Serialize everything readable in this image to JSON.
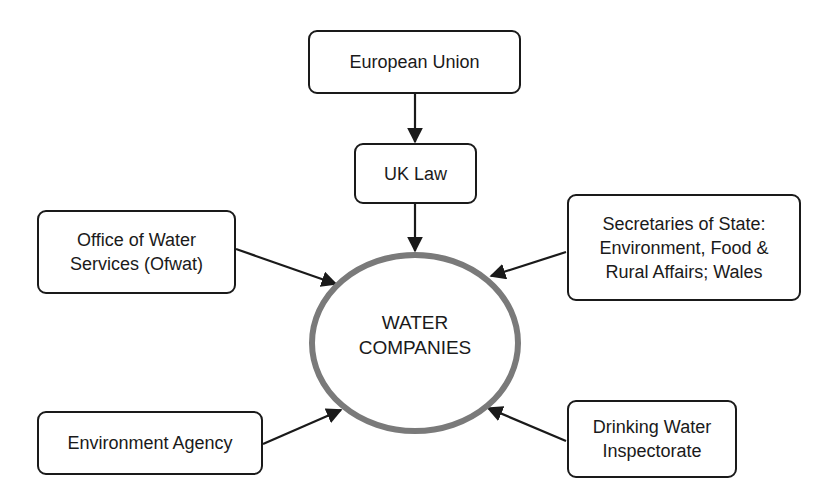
{
  "diagram": {
    "nodes": {
      "eu": {
        "label": "European Union"
      },
      "uk_law": {
        "label": "UK Law"
      },
      "ofwat": {
        "line1": "Office of Water",
        "line2": "Services (Ofwat)"
      },
      "secretaries": {
        "line1": "Secretaries of State:",
        "line2": "Environment, Food &",
        "line3": "Rural Affairs; Wales"
      },
      "env_agency": {
        "label": "Environment Agency"
      },
      "dwi": {
        "line1": "Drinking Water",
        "line2": "Inspectorate"
      },
      "water_companies": {
        "line1": "WATER",
        "line2": "COMPANIES"
      }
    },
    "edges": [
      {
        "from": "European Union",
        "to": "UK Law"
      },
      {
        "from": "UK Law",
        "to": "WATER COMPANIES"
      },
      {
        "from": "Office of Water Services (Ofwat)",
        "to": "WATER COMPANIES"
      },
      {
        "from": "Secretaries of State: Environment, Food & Rural Affairs; Wales",
        "to": "WATER COMPANIES"
      },
      {
        "from": "Environment Agency",
        "to": "WATER COMPANIES"
      },
      {
        "from": "Drinking Water Inspectorate",
        "to": "WATER COMPANIES"
      }
    ],
    "colors": {
      "line": "#1a1a1a",
      "ellipse_stroke": "#7a7a7a",
      "background": "#ffffff"
    }
  }
}
